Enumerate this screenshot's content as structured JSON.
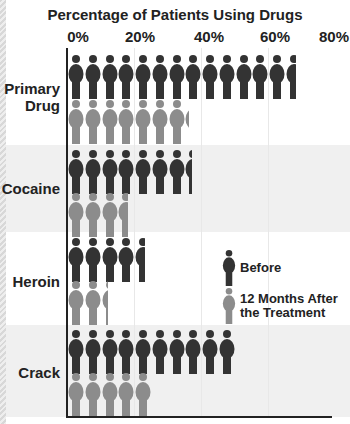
{
  "chart_data": {
    "type": "bar",
    "title": "Percentage of Patients Using Drugs",
    "xlabel": "",
    "ylabel": "",
    "xlim": [
      0,
      80
    ],
    "ticks": [
      "0%",
      "20%",
      "40%",
      "60%",
      "80%"
    ],
    "orientation": "horizontal",
    "glyph": "person-icon",
    "unit_per_icon": 5,
    "categories": [
      "Primary Drug",
      "Cocaine",
      "Heroin",
      "Crack"
    ],
    "series": [
      {
        "name": "Before",
        "color": "#333333",
        "values": [
          68,
          37,
          23,
          50
        ]
      },
      {
        "name": "12 Months After the Treatment",
        "color": "#8c8c8c",
        "values": [
          36,
          18,
          12,
          25
        ]
      }
    ],
    "legend_position": "right-inside"
  },
  "title": "Percentage of Patients Using Drugs",
  "ticks": [
    "0%",
    "20%",
    "40%",
    "60%",
    "80%"
  ],
  "categories": [
    {
      "line1": "Primary",
      "line2": "Drug"
    },
    {
      "line1": "Cocaine",
      "line2": ""
    },
    {
      "line1": "Heroin",
      "line2": ""
    },
    {
      "line1": "Crack",
      "line2": ""
    }
  ],
  "legend": {
    "before": "Before",
    "after_line1": "12 Months After",
    "after_line2": "the Treatment"
  }
}
